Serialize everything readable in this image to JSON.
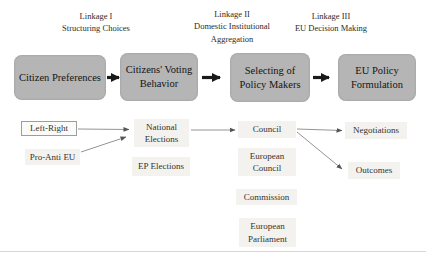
{
  "figure": {
    "type": "flow-diagram",
    "topic": "EU policy linkage model"
  },
  "headings": [
    {
      "id": "linkage-1",
      "text": "Linkage I\nStructuring Choices"
    },
    {
      "id": "linkage-2",
      "text": "Linkage II\nDomestic Institutional\nAggregation"
    },
    {
      "id": "linkage-3",
      "text": "Linkage III\nEU Decision Making"
    }
  ],
  "main_boxes": [
    {
      "id": "citizen-preferences",
      "label": "Citizen Preferences"
    },
    {
      "id": "citizens-voting-behavior",
      "label": "Citizens' Voting Behavior"
    },
    {
      "id": "selecting-policy-makers",
      "label": "Selecting of Policy Makers"
    },
    {
      "id": "eu-policy-formulation",
      "label": "EU Policy Formulation"
    }
  ],
  "sub_boxes": {
    "left_right": "Left-Right",
    "pro_anti_eu": "Pro-Anti EU",
    "national_elections": "National Elections",
    "ep_elections": "EP Elections",
    "council": "Council",
    "european_council": "European Council",
    "commission": "Commission",
    "european_parliament": "European Parliament",
    "negotiations": "Negotiations",
    "outcomes": "Outcomes"
  },
  "arrows": {
    "thick": [
      "citizen-preferences -> citizens-voting-behavior",
      "citizens-voting-behavior -> selecting-policy-makers",
      "selecting-policy-makers -> eu-policy-formulation"
    ],
    "thin": [
      "left-right -> national-elections",
      "pro-anti-eu -> national-elections",
      "national-elections -> council",
      "council -> negotiations",
      "council -> outcomes"
    ]
  },
  "colors": {
    "main_box_fill": "#b5b5b5",
    "sub_box_fill": "#f3f2ee",
    "bordered_box_fill": "#fbfbf9",
    "thick_arrow": "#1a1a1a",
    "thin_arrow": "#777777",
    "text": "#1f1f1f"
  }
}
